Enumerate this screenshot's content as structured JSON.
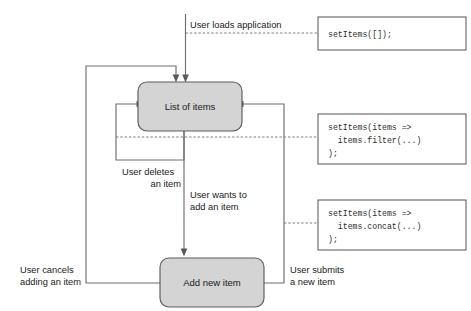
{
  "diagram": {
    "colors": {
      "node_fill": "#d4d4d4",
      "node_stroke": "#5c5c5c",
      "line": "#6e6e6e",
      "dashed_line": "#777777",
      "text": "#1a1a1a",
      "code_box_fill": "#ffffff",
      "background": "#ffffff"
    },
    "nodes": [
      {
        "id": "list-of-items",
        "label": "List of items"
      },
      {
        "id": "add-new-item",
        "label": "Add new item"
      }
    ],
    "edge_labels": [
      {
        "id": "loads-application",
        "line1": "User loads application",
        "line2": ""
      },
      {
        "id": "deletes-an-item",
        "line1": "User deletes",
        "line2": "an item"
      },
      {
        "id": "wants-to-add",
        "line1": "User wants to",
        "line2": "add an item"
      },
      {
        "id": "cancels-adding",
        "line1": "User cancels",
        "line2": "adding an item"
      },
      {
        "id": "submits-new-item",
        "line1": "User submits",
        "line2": "a new item"
      }
    ],
    "code_boxes": [
      {
        "id": "set-items-empty",
        "lines": [
          "setItems([]);"
        ]
      },
      {
        "id": "set-items-filter",
        "lines": [
          "setItems(items =>",
          "  items.filter(...)",
          ");"
        ]
      },
      {
        "id": "set-items-concat",
        "lines": [
          "setItems(items =>",
          "  items.concat(...)",
          ");"
        ]
      }
    ]
  }
}
